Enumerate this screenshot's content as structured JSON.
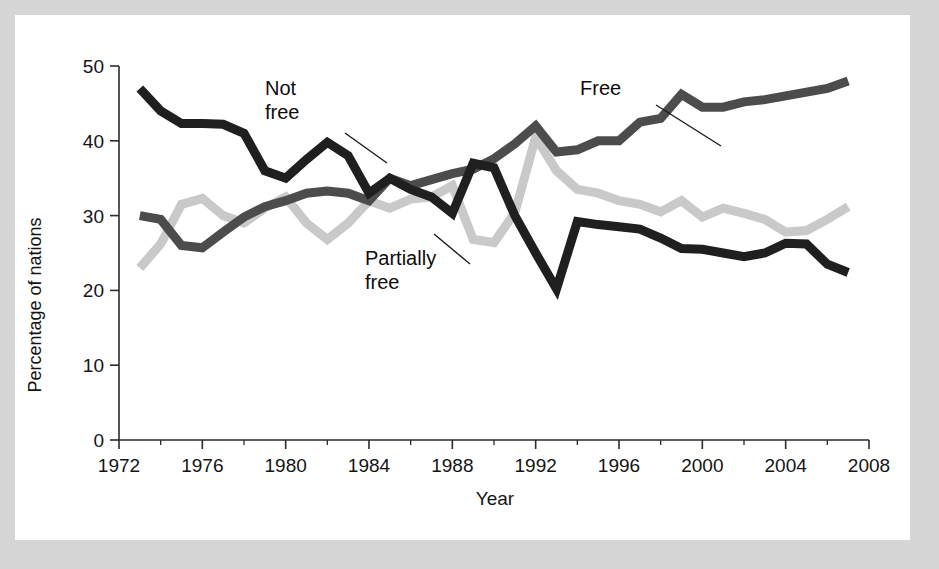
{
  "figure": {
    "background_color": "#d6d6d6",
    "card_color": "#ffffff"
  },
  "chart_data": {
    "type": "line",
    "title": "",
    "xlabel": "Year",
    "ylabel": "Percentage of nations",
    "xlim": [
      1972,
      2008
    ],
    "ylim": [
      0,
      50
    ],
    "grid": false,
    "legend_position": "inline-annotations",
    "x_ticks": [
      1972,
      1976,
      1980,
      1984,
      1988,
      1992,
      1996,
      2000,
      2004,
      2008
    ],
    "x_minor_ticks": [
      1974,
      1978,
      1982,
      1986,
      1990,
      1994,
      1998,
      2002,
      2006
    ],
    "y_ticks": [
      0,
      10,
      20,
      30,
      40,
      50
    ],
    "x": [
      1973,
      1974,
      1975,
      1976,
      1977,
      1978,
      1979,
      1980,
      1981,
      1982,
      1983,
      1984,
      1985,
      1986,
      1987,
      1988,
      1989,
      1990,
      1991,
      1992,
      1993,
      1994,
      1995,
      1996,
      1997,
      1998,
      1999,
      2000,
      2001,
      2002,
      2003,
      2004,
      2005,
      2006,
      2007
    ],
    "series": [
      {
        "name": "Not free",
        "color": "#1f1f1f",
        "values": [
          47.0,
          44.0,
          42.3,
          42.3,
          42.2,
          41.0,
          36.0,
          35.0,
          37.5,
          39.8,
          38.0,
          33.0,
          35.0,
          33.5,
          32.5,
          30.3,
          37.0,
          36.4,
          30.0,
          25.0,
          20.2,
          29.2,
          28.8,
          28.5,
          28.2,
          27.0,
          25.6,
          25.5,
          25.0,
          24.5,
          25.0,
          26.3,
          26.2,
          23.5,
          22.4
        ]
      },
      {
        "name": "Free",
        "color": "#4c4c4c",
        "values": [
          30.0,
          29.5,
          26.0,
          25.7,
          27.8,
          29.8,
          31.2,
          32.0,
          33.0,
          33.3,
          33.0,
          32.0,
          35.0,
          34.0,
          34.8,
          35.6,
          36.2,
          37.6,
          39.6,
          42.0,
          38.5,
          38.8,
          40.0,
          40.0,
          42.5,
          43.0,
          46.2,
          44.5,
          44.5,
          45.2,
          45.5,
          46.0,
          46.5,
          47.0,
          48.0
        ]
      },
      {
        "name": "Partially free",
        "color": "#c9c9c9",
        "values": [
          23.0,
          26.2,
          31.5,
          32.3,
          30.0,
          29.0,
          31.0,
          32.5,
          29.0,
          26.8,
          29.0,
          32.0,
          31.0,
          32.2,
          32.5,
          34.0,
          26.8,
          26.4,
          30.4,
          40.5,
          36.0,
          33.5,
          33.0,
          32.0,
          31.5,
          30.5,
          32.0,
          29.8,
          31.0,
          30.3,
          29.5,
          27.8,
          28.0,
          29.5,
          31.2
        ]
      }
    ],
    "annotations": [
      {
        "id": "not-free",
        "label_line1": "Not",
        "label_line2": "free",
        "text_x": 265,
        "text_y": 95
      },
      {
        "id": "free",
        "label_line1": "Free",
        "label_line2": "",
        "text_x": 580,
        "text_y": 95
      },
      {
        "id": "partially-free",
        "label_line1": "Partially",
        "label_line2": "free",
        "text_x": 365,
        "text_y": 265
      }
    ]
  }
}
